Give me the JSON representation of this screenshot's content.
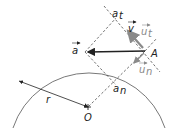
{
  "diagram": {
    "labels": {
      "a_vec": "a",
      "a_t": "a",
      "a_t_sub": "t",
      "a_n": "a",
      "a_n_sub": "n",
      "v": "v",
      "u_t": "u",
      "u_t_sub": "t",
      "u_n": "u",
      "u_n_sub": "n",
      "A": "A",
      "O": "O",
      "r": "r"
    },
    "colors": {
      "main": "#222222",
      "gray": "#8a8a8a",
      "dashed": "#333333"
    }
  }
}
